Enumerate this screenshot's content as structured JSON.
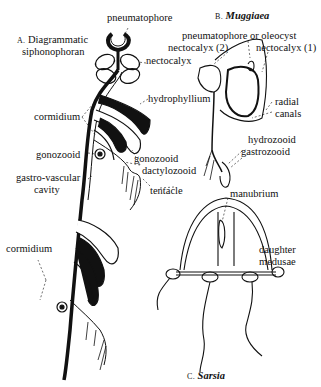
{
  "figure": {
    "panel_a": {
      "letter": "A.",
      "title_line1": "Diagrammatic",
      "title_line2": "siphonophoran",
      "labels": {
        "pneumatophore": "pneumatophore",
        "nectocalyx": "nectocalyx",
        "hydrophyllium": "hydrophyllium",
        "cormidium_top": "cormidium",
        "gonozooid_left": "gonozooid",
        "gastro_vascular_line1": "gastro-vascular",
        "gastro_vascular_line2": "cavity",
        "gonozooid_right": "gonozooid",
        "dactylozooid": "dactylozooid",
        "tentacle": "tentacle",
        "cormidium_bottom": "cormidium"
      }
    },
    "panel_b": {
      "letter": "B.",
      "genus": "Muggiaea",
      "labels": {
        "pneumatophore_or_oleocyst": "pneumatophore or oleocyst",
        "nectocalyx_2": "nectocalyx (2)",
        "nectocalyx_1": "nectocalyx (1)",
        "radial": "radial",
        "canals": "canals",
        "hydrozooid": "hydrozooid",
        "gastrozooid": "gastrozooid"
      }
    },
    "panel_c": {
      "letter": "C.",
      "genus": "Sarsia",
      "labels": {
        "manubrium": "manubrium",
        "daughter": "daughter",
        "medusae": "medusae"
      }
    }
  }
}
